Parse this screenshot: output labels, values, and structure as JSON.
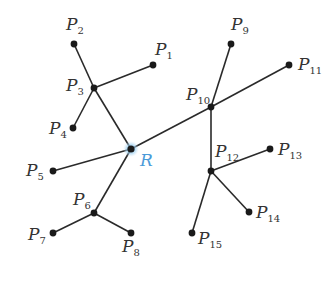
{
  "diagram": {
    "type": "tree",
    "root": {
      "id": "R",
      "label": "R",
      "x": 131,
      "y": 149,
      "color": "#4a9ad8",
      "halo_color": "#9fd0f0"
    },
    "nodes": [
      {
        "id": "P1",
        "label": "P",
        "sub": "1",
        "x": 153,
        "y": 65,
        "lx": 155,
        "ly": 55,
        "anchor": "start"
      },
      {
        "id": "P2",
        "label": "P",
        "sub": "2",
        "x": 74,
        "y": 44,
        "lx": 66,
        "ly": 30,
        "anchor": "start"
      },
      {
        "id": "P3",
        "label": "P",
        "sub": "3",
        "x": 94,
        "y": 88,
        "lx": 66,
        "ly": 91,
        "anchor": "start"
      },
      {
        "id": "P4",
        "label": "P",
        "sub": "4",
        "x": 73,
        "y": 128,
        "lx": 49,
        "ly": 134,
        "anchor": "start"
      },
      {
        "id": "P5",
        "label": "P",
        "sub": "5",
        "x": 53,
        "y": 171,
        "lx": 26,
        "ly": 176,
        "anchor": "start"
      },
      {
        "id": "P6",
        "label": "P",
        "sub": "6",
        "x": 94,
        "y": 213,
        "lx": 73,
        "ly": 205,
        "anchor": "start"
      },
      {
        "id": "P7",
        "label": "P",
        "sub": "7",
        "x": 53,
        "y": 233,
        "lx": 28,
        "ly": 240,
        "anchor": "start"
      },
      {
        "id": "P8",
        "label": "P",
        "sub": "8",
        "x": 131,
        "y": 233,
        "lx": 122,
        "ly": 252,
        "anchor": "start"
      },
      {
        "id": "P9",
        "label": "P",
        "sub": "9",
        "x": 231,
        "y": 44,
        "lx": 231,
        "ly": 30,
        "anchor": "start"
      },
      {
        "id": "P10",
        "label": "P",
        "sub": "10",
        "x": 211,
        "y": 107,
        "lx": 186,
        "ly": 100,
        "anchor": "start"
      },
      {
        "id": "P11",
        "label": "P",
        "sub": "11",
        "x": 289,
        "y": 65,
        "lx": 298,
        "ly": 70,
        "anchor": "start"
      },
      {
        "id": "P12",
        "label": "P",
        "sub": "12",
        "x": 211,
        "y": 171,
        "lx": 215,
        "ly": 157,
        "anchor": "start"
      },
      {
        "id": "P13",
        "label": "P",
        "sub": "13",
        "x": 270,
        "y": 149,
        "lx": 278,
        "ly": 155,
        "anchor": "start"
      },
      {
        "id": "P14",
        "label": "P",
        "sub": "14",
        "x": 249,
        "y": 212,
        "lx": 256,
        "ly": 218,
        "anchor": "start"
      },
      {
        "id": "P15",
        "label": "P",
        "sub": "15",
        "x": 192,
        "y": 233,
        "lx": 198,
        "ly": 244,
        "anchor": "start"
      }
    ],
    "edges": [
      [
        "R",
        "P3"
      ],
      [
        "P3",
        "P2"
      ],
      [
        "P3",
        "P1"
      ],
      [
        "P3",
        "P4"
      ],
      [
        "R",
        "P5"
      ],
      [
        "R",
        "P6"
      ],
      [
        "P6",
        "P7"
      ],
      [
        "P6",
        "P8"
      ],
      [
        "R",
        "P10"
      ],
      [
        "P10",
        "P9"
      ],
      [
        "P10",
        "P11"
      ],
      [
        "P10",
        "P12"
      ],
      [
        "P12",
        "P13"
      ],
      [
        "P12",
        "P14"
      ],
      [
        "P12",
        "P15"
      ]
    ],
    "colors": {
      "edge": "#2a2a2a",
      "node": "#1a1a1a",
      "label": "#333333"
    }
  }
}
